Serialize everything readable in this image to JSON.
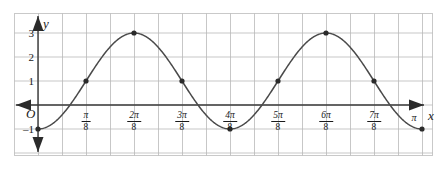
{
  "figure": {
    "axes": {
      "x_axis_label": "x",
      "y_axis_label": "y",
      "origin_label": "O"
    },
    "y_ticks": [
      {
        "value": 3,
        "label": "3"
      },
      {
        "value": 2,
        "label": "2"
      },
      {
        "value": 1,
        "label": "1"
      },
      {
        "value": -1,
        "label": "–1"
      }
    ],
    "x_ticks": [
      {
        "value": 0.3926990817,
        "numerator": "π",
        "denominator": "8",
        "label": "π/8"
      },
      {
        "value": 0.7853981634,
        "numerator": "2π",
        "denominator": "8",
        "label": "2π/8"
      },
      {
        "value": 1.1780972451,
        "numerator": "3π",
        "denominator": "8",
        "label": "3π/8"
      },
      {
        "value": 1.5707963268,
        "numerator": "4π",
        "denominator": "8",
        "label": "4π/8"
      },
      {
        "value": 1.9634954085,
        "numerator": "5π",
        "denominator": "8",
        "label": "5π/8"
      },
      {
        "value": 2.3561944902,
        "numerator": "6π",
        "denominator": "8",
        "label": "6π/8"
      },
      {
        "value": 2.7488935719,
        "numerator": "7π",
        "denominator": "8",
        "label": "7π/8"
      }
    ],
    "x_end_tick": {
      "value": 3.1415926536,
      "label": "π"
    },
    "colors": {
      "grid": "#b9b9b9",
      "axis": "#3a3a3a",
      "curve": "#4a4a4a",
      "point": "#2b2b2b",
      "border": "#c9c9c9",
      "background": "#ffffff"
    }
  },
  "chart_data": {
    "type": "line",
    "title": "",
    "xlabel": "x",
    "ylabel": "y",
    "grid": true,
    "legend": "none",
    "xlim": [
      0,
      3.1415926536
    ],
    "ylim": [
      -1.5,
      3.5
    ],
    "x_tick_labels": [
      "π/8",
      "2π/8",
      "3π/8",
      "4π/8",
      "5π/8",
      "6π/8",
      "7π/8",
      "π"
    ],
    "x_tick_values": [
      0.3927,
      0.7854,
      1.1781,
      1.5708,
      1.9635,
      2.3562,
      2.7489,
      3.1416
    ],
    "y_tick_labels": [
      "3",
      "2",
      "1",
      "–1"
    ],
    "y_tick_values": [
      3,
      2,
      1,
      -1
    ],
    "equation": "y = 1 - 2cos(4x)",
    "amplitude": 2,
    "vertical_shift": 1,
    "period": 1.5707963268,
    "marked_points": [
      {
        "x": 0,
        "y": -1,
        "x_label": "0"
      },
      {
        "x": 0.3927,
        "y": 1,
        "x_label": "π/8"
      },
      {
        "x": 0.7854,
        "y": 3,
        "x_label": "2π/8"
      },
      {
        "x": 1.1781,
        "y": 1,
        "x_label": "3π/8"
      },
      {
        "x": 1.5708,
        "y": -1,
        "x_label": "4π/8"
      },
      {
        "x": 1.9635,
        "y": 1,
        "x_label": "5π/8"
      },
      {
        "x": 2.3562,
        "y": 3,
        "x_label": "6π/8"
      },
      {
        "x": 2.7489,
        "y": 1,
        "x_label": "7π/8"
      },
      {
        "x": 3.1416,
        "y": -1,
        "x_label": "π"
      }
    ],
    "series": [
      {
        "name": "y = 1 - 2cos(4x)",
        "x": [
          0,
          0.0982,
          0.1963,
          0.2945,
          0.3927,
          0.4909,
          0.589,
          0.6872,
          0.7854,
          0.8836,
          0.9817,
          1.0799,
          1.1781,
          1.2763,
          1.3744,
          1.4726,
          1.5708,
          1.669,
          1.7671,
          1.8653,
          1.9635,
          2.0617,
          2.1598,
          2.258,
          2.3562,
          2.4544,
          2.5525,
          2.6507,
          2.7489,
          2.8471,
          2.9452,
          3.0434,
          3.1416
        ],
        "y": [
          -1,
          -0.586,
          0.414,
          1.586,
          2.414,
          2.848,
          3.0,
          2.848,
          3.0,
          2.414,
          1.586,
          0.414,
          1,
          0,
          -0.586,
          -0.848,
          -1,
          -0.848,
          -0.586,
          0.414,
          1,
          1.586,
          2.414,
          2.848,
          3,
          2.848,
          2.414,
          1.586,
          1,
          0.414,
          -0.586,
          -0.848,
          -1
        ]
      }
    ]
  }
}
